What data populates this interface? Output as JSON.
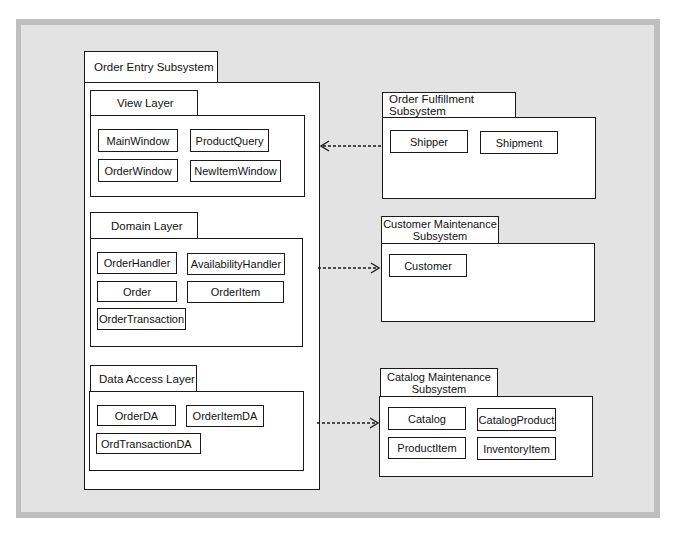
{
  "packages": {
    "order_entry": {
      "title": "Order Entry Subsystem",
      "view_layer": {
        "title": "View Layer",
        "classes": [
          "MainWindow",
          "ProductQuery",
          "OrderWindow",
          "NewItemWindow"
        ]
      },
      "domain_layer": {
        "title": "Domain Layer",
        "classes": [
          "OrderHandler",
          "AvailabilityHandler",
          "Order",
          "OrderItem",
          "OrderTransaction"
        ]
      },
      "data_access_layer": {
        "title": "Data Access Layer",
        "classes": [
          "OrderDA",
          "OrderItemDA",
          "OrdTransactionDA"
        ]
      }
    },
    "order_fulfillment": {
      "title": "Order Fulfillment Subsystem",
      "classes": [
        "Shipper",
        "Shipment"
      ]
    },
    "customer_maintenance": {
      "title_line1": "Customer Maintenance",
      "title_line2": "Subsystem",
      "classes": [
        "Customer"
      ]
    },
    "catalog_maintenance": {
      "title_line1": "Catalog Maintenance",
      "title_line2": "Subsystem",
      "classes": [
        "Catalog",
        "CatalogProduct",
        "ProductItem",
        "InventoryItem"
      ]
    }
  },
  "dependencies": [
    {
      "from": "Order Fulfillment Subsystem",
      "to": "View Layer",
      "style": "dashed"
    },
    {
      "from": "Domain Layer",
      "to": "Customer Maintenance Subsystem",
      "style": "dashed"
    },
    {
      "from": "Data Access Layer",
      "to": "Catalog Maintenance Subsystem",
      "style": "dashed"
    }
  ],
  "colors": {
    "frame_border": "#bfbfbf",
    "frame_fill": "#e3e3e3",
    "box_fill": "#ffffff",
    "line": "#1a1a1a"
  }
}
